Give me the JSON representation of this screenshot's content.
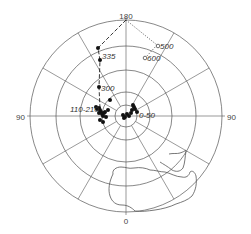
{
  "figure": {
    "title": "",
    "projection": "polar",
    "axis_labels": {
      "top": "180",
      "left": "90",
      "right": "90",
      "bottom": "0"
    },
    "ring_count": 5,
    "spoke_angles_deg": [
      0,
      30,
      60,
      90,
      120,
      150,
      180,
      210,
      240,
      270,
      300,
      330
    ]
  },
  "annotations": {
    "label_335": "335",
    "label_300": "300",
    "label_110_210": "110-210",
    "label_0_50": "0-50",
    "label_500": "500",
    "label_600": "600"
  },
  "colors": {
    "lines": "#555555",
    "points": "#111111",
    "background": "#ffffff"
  }
}
